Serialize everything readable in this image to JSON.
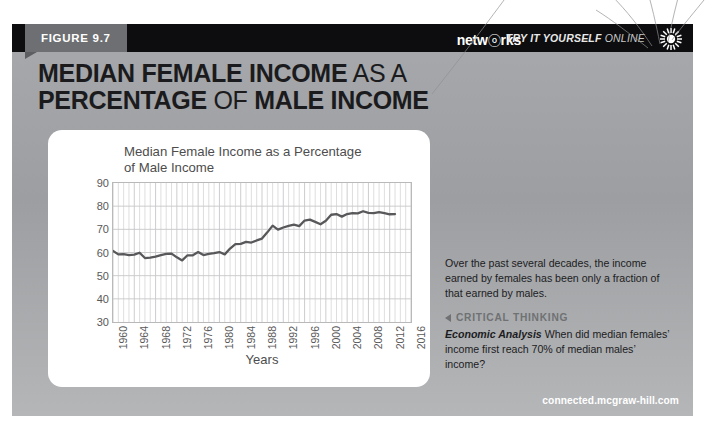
{
  "header": {
    "figure_label": "FIGURE 9.7",
    "brand": "netw",
    "brand_ring": "ⓞ",
    "brand_tail": "rks",
    "try_it_bold": "TRY IT YOURSELF",
    "try_it_light": "ONLINE",
    "sunburst_icon": "sunburst-icon"
  },
  "headline": {
    "line1_bold": "MEDIAN FEMALE INCOME",
    "line1_light": "AS A",
    "line2_bold": "PERCENTAGE",
    "line2_light": "OF",
    "line2_bold2": "MALE INCOME"
  },
  "sidebar": {
    "caption": "Over the past several decades, the income earned by females has been only a fraction of that earned by males.",
    "critical_thinking_label": "CRITICAL THINKING",
    "critical_thinking_arrow": "left-triangle-icon",
    "question_lead": "Economic Analysis",
    "question": "When did median females’ income first reach 70% of median males’ income?"
  },
  "footer": {
    "url": "connected.mcgraw-hill.com"
  },
  "colors": {
    "panel_grey": "#a7a9ac",
    "topbar_black": "#0d0d0f",
    "tab_grey": "#6d6f72",
    "line_color": "#58585b",
    "grid_color": "#c7c7c9",
    "axis_color": "#b9b9b9",
    "accent_grey": "#6f7173"
  },
  "chart_data": {
    "type": "line",
    "title": "Median Female Income as a Percentage of Male Income",
    "xlabel": "Years",
    "ylabel": "",
    "xlim": [
      1960,
      2016
    ],
    "ylim": [
      30,
      90
    ],
    "ytick_step": 10,
    "yticks": [
      30,
      40,
      50,
      60,
      70,
      80,
      90
    ],
    "xticks": [
      1960,
      1964,
      1968,
      1972,
      1976,
      1980,
      1984,
      1988,
      1992,
      1996,
      2000,
      2004,
      2008,
      2012,
      2016
    ],
    "xtick_rotation": -90,
    "grid": "both-axes-minor-vertical-every-year",
    "legend": "none",
    "series": [
      {
        "name": "Median female income as a percentage of male income",
        "x": [
          1960,
          1961,
          1962,
          1963,
          1964,
          1965,
          1966,
          1967,
          1968,
          1969,
          1970,
          1971,
          1972,
          1973,
          1974,
          1975,
          1976,
          1977,
          1978,
          1979,
          1980,
          1981,
          1982,
          1983,
          1984,
          1985,
          1986,
          1987,
          1988,
          1989,
          1990,
          1991,
          1992,
          1993,
          1994,
          1995,
          1996,
          1997,
          1998,
          1999,
          2000,
          2001,
          2002,
          2003,
          2004,
          2005,
          2006,
          2007,
          2008,
          2009,
          2010,
          2011,
          2012,
          2013
        ],
        "values": [
          60.7,
          59.2,
          59.3,
          58.9,
          59.1,
          59.9,
          57.6,
          57.8,
          58.2,
          58.9,
          59.4,
          59.5,
          57.9,
          56.6,
          58.8,
          58.8,
          60.2,
          58.9,
          59.4,
          59.7,
          60.2,
          59.2,
          61.7,
          63.6,
          63.7,
          64.6,
          64.3,
          65.2,
          66.0,
          68.7,
          71.6,
          69.9,
          70.8,
          71.5,
          72.0,
          71.4,
          73.8,
          74.2,
          73.2,
          72.2,
          73.7,
          76.3,
          76.6,
          75.5,
          76.6,
          77.0,
          76.9,
          77.8,
          77.1,
          77.0,
          77.4,
          77.0,
          76.5,
          76.6
        ]
      }
    ],
    "annotations": []
  }
}
